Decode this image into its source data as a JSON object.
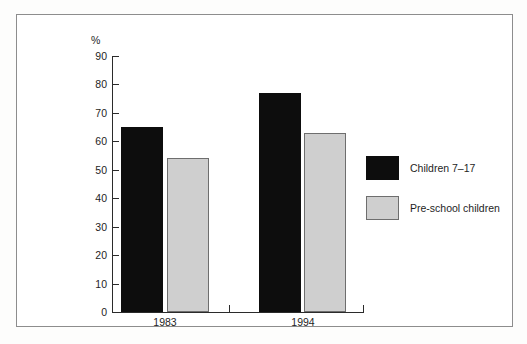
{
  "chart_data": {
    "type": "bar",
    "title": "",
    "xlabel": "",
    "ylabel": "%",
    "ylim": [
      0,
      90
    ],
    "grid": false,
    "legend_position": "right",
    "categories": [
      "1983",
      "1994"
    ],
    "series": [
      {
        "name": "Children 7–17",
        "color": "#0d0d0d",
        "values": [
          65,
          77
        ]
      },
      {
        "name": "Pre-school children",
        "color": "#cfcfcf",
        "values": [
          54,
          63
        ]
      }
    ],
    "yticks": [
      {
        "value": 90,
        "label": "90"
      },
      {
        "value": 80,
        "label": "80"
      },
      {
        "value": 70,
        "label": "70"
      },
      {
        "value": 60,
        "label": "60"
      },
      {
        "value": 50,
        "label": "50"
      },
      {
        "value": 40,
        "label": "40"
      },
      {
        "value": 30,
        "label": "30"
      },
      {
        "value": 20,
        "label": "20"
      },
      {
        "value": 10,
        "label": "10"
      },
      {
        "value": 0,
        "label": "0"
      }
    ]
  },
  "axis": {
    "unit_label": "%"
  },
  "legend": {
    "items": [
      {
        "label": "Children 7–17",
        "swatch": "dark"
      },
      {
        "label": "Pre-school children",
        "swatch": "light"
      }
    ]
  },
  "colors": {
    "dark_series": "#0d0d0d",
    "light_series": "#cfcfcf",
    "axis": "#2b2b2b",
    "frame": "#8d8d8d",
    "background": "#ffffff"
  }
}
